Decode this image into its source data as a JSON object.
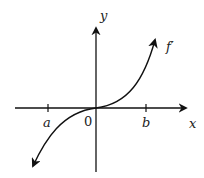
{
  "diagram": {
    "labels": {
      "y_axis": "y",
      "x_axis": "x",
      "origin": "0",
      "tick_a": "a",
      "tick_b": "b",
      "curve": "f′"
    },
    "colors": {
      "stroke": "#111111",
      "background": "#ffffff"
    }
  }
}
